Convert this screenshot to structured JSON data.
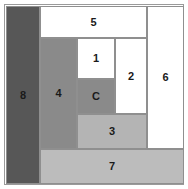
{
  "figure": {
    "canvas": {
      "width": 188,
      "height": 189,
      "background": "#ffffff"
    },
    "frame": {
      "border_color": "#9a9a9a"
    },
    "stroke_color": "#8f8f8f",
    "palette": {
      "white": "#ffffff",
      "dark_gray": "#575757",
      "mid_gray": "#8a8a8a",
      "light_gray": "#b4b4b4",
      "light_gray_2": "#bcbcbc"
    }
  },
  "blocks": [
    {
      "id": "center",
      "label": "C",
      "tone": "mid",
      "color": "#8a8a8a",
      "x": 72,
      "y": 74,
      "w": 38,
      "h": 35
    },
    {
      "id": "b1",
      "label": "1",
      "tone": "white",
      "color": "#ffffff",
      "x": 72,
      "y": 33,
      "w": 38,
      "h": 41
    },
    {
      "id": "b2",
      "label": "2",
      "tone": "white",
      "color": "#ffffff",
      "x": 110,
      "y": 33,
      "w": 32,
      "h": 76
    },
    {
      "id": "b3",
      "label": "3",
      "tone": "light",
      "color": "#b4b4b4",
      "x": 72,
      "y": 109,
      "w": 70,
      "h": 35
    },
    {
      "id": "b4",
      "label": "4",
      "tone": "mid",
      "color": "#8a8a8a",
      "x": 35,
      "y": 33,
      "w": 37,
      "h": 111
    },
    {
      "id": "b5",
      "label": "5",
      "tone": "white",
      "color": "#ffffff",
      "x": 35,
      "y": 1,
      "w": 107,
      "h": 32
    },
    {
      "id": "b6",
      "label": "6",
      "tone": "white",
      "color": "#ffffff",
      "x": 142,
      "y": 1,
      "w": 37,
      "h": 143
    },
    {
      "id": "b7",
      "label": "7",
      "tone": "light2",
      "color": "#bcbcbc",
      "x": 35,
      "y": 144,
      "w": 144,
      "h": 35
    },
    {
      "id": "b8",
      "label": "8",
      "tone": "dark",
      "color": "#575757",
      "x": 1,
      "y": 1,
      "w": 34,
      "h": 178
    }
  ]
}
